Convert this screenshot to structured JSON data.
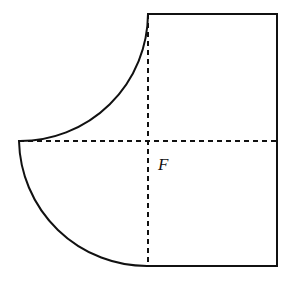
{
  "figure": {
    "name": "composite-region-figure",
    "background_color": "#ffffff",
    "stroke_color": "#111111",
    "canvas": {
      "width": 294,
      "height": 287
    },
    "labels": [
      {
        "id": "center-point",
        "text": "F",
        "x": 158,
        "y": 170,
        "style": "italic"
      }
    ],
    "points": {
      "F": {
        "x": 148,
        "y": 141
      },
      "rect_top_left": {
        "x": 148,
        "y": 14
      },
      "rect_top_right": {
        "x": 277,
        "y": 14
      },
      "rect_bottom_right": {
        "x": 277,
        "y": 266
      },
      "rect_bottom_left": {
        "x": 148,
        "y": 266
      },
      "left_vertex": {
        "x": 19,
        "y": 141
      },
      "arc_center_upper": {
        "x": 19,
        "y": 14
      }
    },
    "radii": {
      "upper_arc": 128,
      "lower_arc": 128
    },
    "solid_outline_path": "M 148 14 L 277 14 L 277 266 L 148 266 A 128 128 0 0 1 19 141 A 128 128 0 0 0 148 14 Z",
    "dashed_lines": [
      {
        "id": "horizontal-axis",
        "x1": 19,
        "y1": 141,
        "x2": 277,
        "y2": 141
      },
      {
        "id": "vertical-axis",
        "x1": 148,
        "y1": 14,
        "x2": 148,
        "y2": 266
      }
    ],
    "dash_pattern": "5 4",
    "stroke_width": 2
  },
  "chart_data": {
    "type": "diagram",
    "title": "",
    "xlabel": "",
    "ylabel": "",
    "annotations": [
      "F"
    ],
    "shapes": [
      {
        "kind": "rectangle",
        "label": "main-rectangle",
        "x": 148,
        "y": 14,
        "width": 129,
        "height": 252
      },
      {
        "kind": "quarter-circle-concave",
        "label": "upper-left-notch-arc",
        "center_x": 19,
        "center_y": 14,
        "radius": 128,
        "start_x": 19,
        "start_y": 141,
        "end_x": 148,
        "end_y": 14
      },
      {
        "kind": "quarter-circle-convex",
        "label": "lower-left-bulge-arc",
        "center_x": 148,
        "center_y": 141,
        "radius": 128,
        "start_x": 19,
        "start_y": 141,
        "end_x": 148,
        "end_y": 266
      }
    ]
  }
}
